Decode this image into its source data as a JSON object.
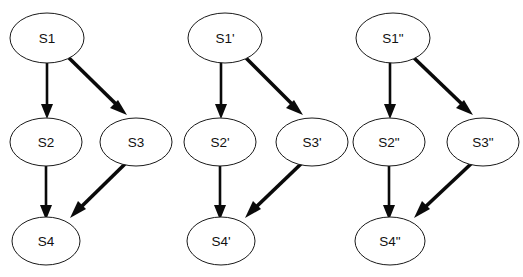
{
  "diagram": {
    "type": "directed-graph",
    "background_color": "#ffffff",
    "node_fill_color": "#ffffff",
    "node_stroke_color": "#1a1a1a",
    "edge_color": "#0a0a0a",
    "text_color": "#111111",
    "groups": [
      {
        "id": "group-unprimed",
        "name": "S",
        "nodes": [
          {
            "id": "s1",
            "label": "S1",
            "cx": 47,
            "cy": 38,
            "rx": 37,
            "ry": 25
          },
          {
            "id": "s2",
            "label": "S2",
            "cx": 46,
            "cy": 142,
            "rx": 36,
            "ry": 24
          },
          {
            "id": "s3",
            "label": "S3",
            "cx": 136,
            "cy": 142,
            "rx": 36,
            "ry": 24
          },
          {
            "id": "s4",
            "label": "S4",
            "cx": 46,
            "cy": 241,
            "rx": 34,
            "ry": 24
          }
        ],
        "edges": [
          {
            "id": "s1-s2",
            "from": "S1",
            "to": "S2",
            "style": "thin",
            "direction": "down"
          },
          {
            "id": "s1-s3",
            "from": "S1",
            "to": "S3",
            "style": "thick",
            "direction": "down-right"
          },
          {
            "id": "s2-s4",
            "from": "S2",
            "to": "S4",
            "style": "thin",
            "direction": "down"
          },
          {
            "id": "s3-s4",
            "from": "S3",
            "to": "S4",
            "style": "thick",
            "direction": "down-left"
          }
        ]
      },
      {
        "id": "group-single-prime",
        "name": "S'",
        "nodes": [
          {
            "id": "s1p",
            "label": "S1'",
            "cx": 225,
            "cy": 38,
            "rx": 37,
            "ry": 25
          },
          {
            "id": "s2p",
            "label": "S2'",
            "cx": 220,
            "cy": 142,
            "rx": 36,
            "ry": 24
          },
          {
            "id": "s3p",
            "label": "S3'",
            "cx": 312,
            "cy": 142,
            "rx": 36,
            "ry": 24
          },
          {
            "id": "s4p",
            "label": "S4'",
            "cx": 221,
            "cy": 241,
            "rx": 34,
            "ry": 24
          }
        ],
        "edges": [
          {
            "id": "s1p-s2p",
            "from": "S1'",
            "to": "S2'",
            "style": "thin",
            "direction": "down"
          },
          {
            "id": "s1p-s3p",
            "from": "S1'",
            "to": "S3'",
            "style": "thick",
            "direction": "down-right"
          },
          {
            "id": "s2p-s4p",
            "from": "S2'",
            "to": "S4'",
            "style": "thin",
            "direction": "down"
          },
          {
            "id": "s3p-s4p",
            "from": "S3'",
            "to": "S4'",
            "style": "thick",
            "direction": "down-left"
          }
        ]
      },
      {
        "id": "group-double-prime",
        "name": "S\"",
        "nodes": [
          {
            "id": "s1pp",
            "label": "S1\"",
            "cx": 393,
            "cy": 38,
            "rx": 37,
            "ry": 25
          },
          {
            "id": "s2pp",
            "label": "S2\"",
            "cx": 389,
            "cy": 142,
            "rx": 36,
            "ry": 24
          },
          {
            "id": "s3pp",
            "label": "S3\"",
            "cx": 483,
            "cy": 142,
            "rx": 36,
            "ry": 24
          },
          {
            "id": "s4pp",
            "label": "S4\"",
            "cx": 390,
            "cy": 241,
            "rx": 35,
            "ry": 24
          }
        ],
        "edges": [
          {
            "id": "s1pp-s2pp",
            "from": "S1\"",
            "to": "S2\"",
            "style": "thin",
            "direction": "down"
          },
          {
            "id": "s1pp-s3pp",
            "from": "S1\"",
            "to": "S3\"",
            "style": "thick",
            "direction": "down-right"
          },
          {
            "id": "s2pp-s4pp",
            "from": "S2\"",
            "to": "S4\"",
            "style": "thin",
            "direction": "down"
          },
          {
            "id": "s3pp-s4pp",
            "from": "S3\"",
            "to": "S4\"",
            "style": "thick",
            "direction": "down-left"
          }
        ]
      }
    ]
  }
}
